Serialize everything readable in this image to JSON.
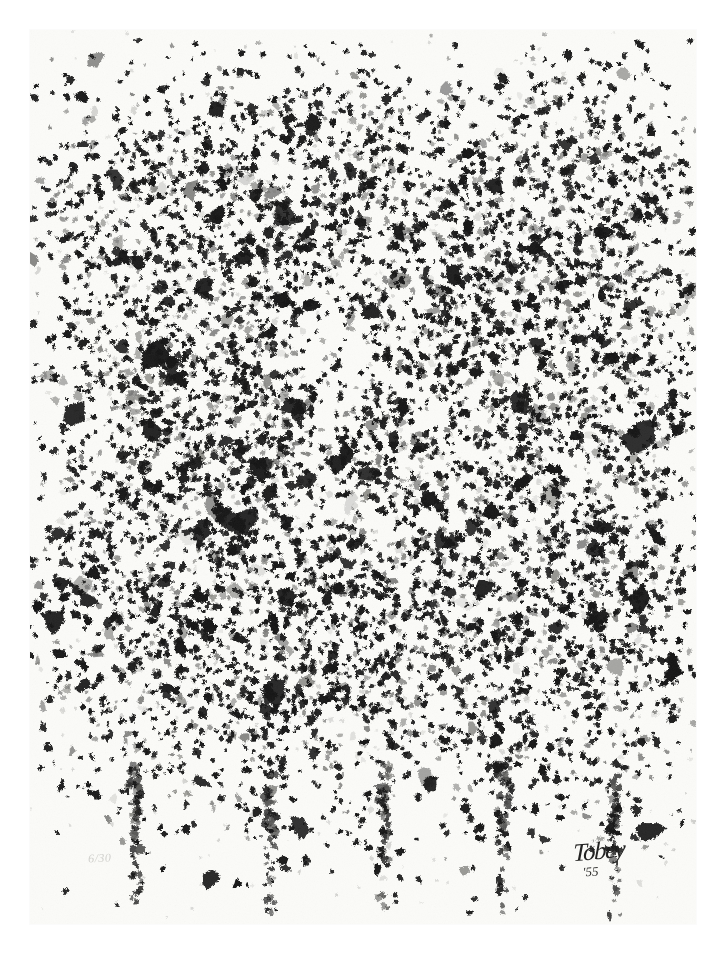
{
  "artwork": {
    "title": "Untitled abstract composition",
    "medium_appearance": "black ink marks on cream paper",
    "orientation": "portrait",
    "background_color": "#ffffff",
    "paper_color": "#fbfbf8",
    "ink_color": "#161616",
    "mid_ink_color": "#5a5a58",
    "light_ink_color": "#9a9a97"
  },
  "inscriptions": {
    "edition_number": "6/30",
    "artist_signature": "Tobey",
    "signature_year": "'55"
  },
  "composition": {
    "column_count": 5,
    "description": "five vertical tapering columns of irregular black blots, densest in the upper and middle bands, dissolving into thin trailing tails at the bottom",
    "columns": [
      {
        "name": "column-1",
        "center_x": 0.16,
        "peak_y": 0.1,
        "width": 0.2,
        "density": 0.85
      },
      {
        "name": "column-2",
        "center_x": 0.36,
        "peak_y": 0.05,
        "width": 0.19,
        "density": 0.9
      },
      {
        "name": "column-3",
        "center_x": 0.53,
        "peak_y": 0.03,
        "width": 0.18,
        "density": 0.95
      },
      {
        "name": "column-4",
        "center_x": 0.71,
        "peak_y": 0.05,
        "width": 0.19,
        "density": 0.92
      },
      {
        "name": "column-5",
        "center_x": 0.88,
        "peak_y": 0.04,
        "width": 0.18,
        "density": 0.88
      }
    ],
    "void": {
      "name": "central-light-void",
      "center_x": 0.45,
      "center_y": 0.37,
      "radius": 0.09
    }
  }
}
